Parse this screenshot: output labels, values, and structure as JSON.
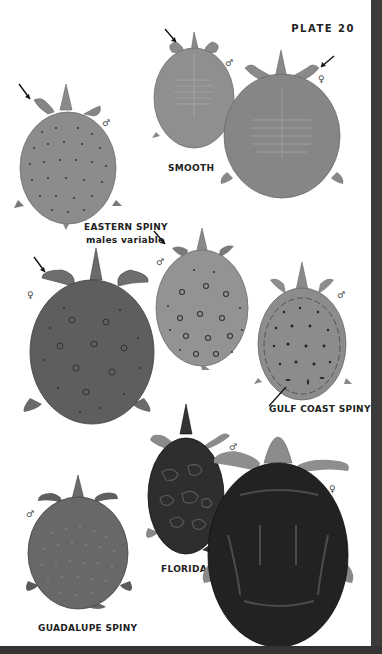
{
  "plate": {
    "number_label": "PLATE 20"
  },
  "colors": {
    "page_bg": "#ffffff",
    "frame_dark": "#3a3a3a",
    "label_text": "#222222"
  },
  "species": [
    {
      "id": "smooth",
      "label": "SMOOTH",
      "figures": [
        {
          "sex": "♂",
          "carapace": "#8f8f8f",
          "pattern": "ridges",
          "arrow": true
        },
        {
          "sex": "♀",
          "carapace": "#888888",
          "pattern": "ridges-mottled",
          "arrow": true
        }
      ]
    },
    {
      "id": "eastern-spiny",
      "label": "EASTERN SPINY",
      "sublabel": "males variable",
      "figures": [
        {
          "sex": "♂",
          "carapace": "#8a8a8a",
          "pattern": "small-dots",
          "arrow": true
        },
        {
          "sex": "♀",
          "carapace": "#5e5e5e",
          "pattern": "mottled-ocelli",
          "arrow": true
        },
        {
          "sex": "♂",
          "carapace": "#939393",
          "pattern": "ocelli",
          "arrow": true
        }
      ]
    },
    {
      "id": "gulf-coast-spiny",
      "label": "GULF COAST SPINY",
      "figures": [
        {
          "sex": "♂",
          "carapace": "#8c8c8c",
          "pattern": "dots-dashes-rim-line",
          "arrow": false
        }
      ]
    },
    {
      "id": "florida",
      "label": "FLORIDA",
      "figures": [
        {
          "sex": "♂",
          "carapace": "#2e2e2e",
          "pattern": "reticulated",
          "arrow": false
        },
        {
          "sex": "♀",
          "carapace": "#222222",
          "pattern": "dark-blotched",
          "arrow": false
        }
      ]
    },
    {
      "id": "guadalupe-spiny",
      "label": "GUADALUPE SPINY",
      "figures": [
        {
          "sex": "♂",
          "carapace": "#6a6a6a",
          "pattern": "white-speckles",
          "arrow": false
        }
      ]
    }
  ]
}
